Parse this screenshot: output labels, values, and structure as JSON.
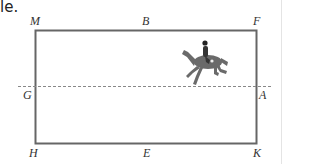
{
  "lead_text": "le.",
  "diagram": {
    "type": "dressage-arena",
    "letters": {
      "top_left": "M",
      "top_middle": "B",
      "top_right": "F",
      "middle_left": "G",
      "middle_right": "A",
      "bottom_left": "H",
      "bottom_middle": "E",
      "bottom_right": "K"
    },
    "centerline_style": "dashed",
    "figure": "horse-and-rider",
    "colors": {
      "border": "#666666",
      "dash": "#888888",
      "horse": "#6a6a6a"
    }
  }
}
